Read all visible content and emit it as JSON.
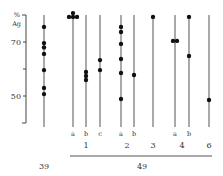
{
  "chart_data": {
    "type": "scatter",
    "title": "",
    "ylabel": "% Ag",
    "ylabel_lines": [
      "%",
      "Ag"
    ],
    "ylim": [
      40,
      80
    ],
    "yticks": [
      {
        "value": 70,
        "label": "70"
      },
      {
        "value": 60,
        "label": ""
      },
      {
        "value": 50,
        "label": "50"
      }
    ],
    "grid": false,
    "legend": null,
    "columns": [
      {
        "id": "39",
        "sublabel": "",
        "group": "39",
        "x": 44,
        "values": [
          75.6,
          69.6,
          68.0,
          65.6,
          59.6,
          53.0,
          50.7
        ]
      },
      {
        "id": "1a",
        "sublabel": "a",
        "group": "1",
        "x": 73,
        "values": [
          80.7,
          79.3,
          79.3,
          79.3
        ]
      },
      {
        "id": "1b",
        "sublabel": "b",
        "group": "1",
        "x": 86,
        "values": [
          58.9,
          57.4,
          55.9
        ]
      },
      {
        "id": "1c",
        "sublabel": "c",
        "group": "1",
        "x": 100,
        "values": [
          63.3,
          59.6
        ]
      },
      {
        "id": "2a",
        "sublabel": "a",
        "group": "2",
        "x": 121,
        "values": [
          75.6,
          73.7,
          69.3,
          63.7,
          58.5,
          48.9
        ]
      },
      {
        "id": "2b",
        "sublabel": "b",
        "group": "2",
        "x": 134,
        "values": [
          57.8
        ]
      },
      {
        "id": "3",
        "sublabel": "",
        "group": "3",
        "x": 153,
        "values": [
          79.3
        ]
      },
      {
        "id": "4a",
        "sublabel": "a",
        "group": "4",
        "x": 175,
        "values": [
          70.4,
          70.4
        ]
      },
      {
        "id": "4b",
        "sublabel": "b",
        "group": "4",
        "x": 189,
        "values": [
          79.3,
          64.8
        ]
      },
      {
        "id": "6",
        "sublabel": "",
        "group": "6",
        "x": 209,
        "values": [
          48.5
        ]
      }
    ],
    "group_labels": [
      {
        "label": "1",
        "x": 86
      },
      {
        "label": "2",
        "x": 127
      },
      {
        "label": "3",
        "x": 153
      },
      {
        "label": "4",
        "x": 182
      },
      {
        "label": "6",
        "x": 209
      }
    ],
    "category_labels": [
      {
        "label": "39",
        "x": 44
      },
      {
        "label": "49",
        "x": 142
      }
    ]
  }
}
